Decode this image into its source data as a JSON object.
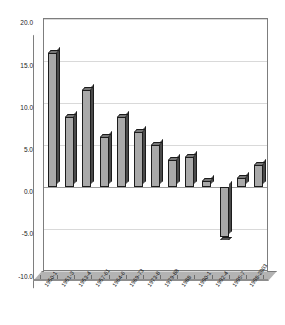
{
  "chart_data": {
    "type": "bar",
    "title": "",
    "subtitle": "",
    "xlabel": "",
    "ylabel": "",
    "ylim": [
      -10.0,
      20.0
    ],
    "yticks": [
      "20.0",
      "15.0",
      "10.0",
      "5.0",
      "0.0",
      "-5.0",
      "-10.0"
    ],
    "ytick_values": [
      20.0,
      15.0,
      10.0,
      5.0,
      0.0,
      -5.0,
      -10.0
    ],
    "grid": true,
    "legend": false,
    "legend_position": "none",
    "style": "3d-column",
    "categories": [
      "1950-1",
      "1951-3",
      "1953-4",
      "1957-61",
      "1964-6",
      "1969-73",
      "1973-8",
      "1979-88",
      "1988",
      "1990-1",
      "1992-4",
      "1995-7",
      "1998-2003"
    ],
    "values": [
      16.0,
      8.3,
      11.6,
      6.0,
      8.3,
      6.5,
      5.0,
      3.2,
      3.6,
      0.7,
      -5.9,
      1.1,
      2.6
    ]
  },
  "colors": {
    "bar_face": "#a9a9a9",
    "bar_outline": "#1c1c1c",
    "bar_side": "#4a4a4a",
    "bar_top": "#767676",
    "gridline": "#d9d9d9",
    "zero_line": "#9c9c9c",
    "floor": "#b3b3b3",
    "wall_border": "#7d7d7d",
    "background": "#ffffff",
    "text": "#111111"
  }
}
